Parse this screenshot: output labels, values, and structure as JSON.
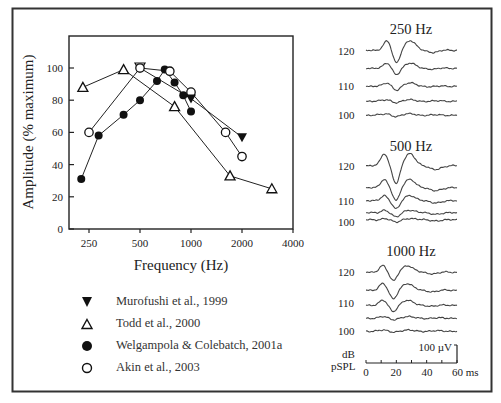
{
  "figure": {
    "frame_color": "#333333",
    "left_panel": {
      "ylabel": "Amplitude (% maximum)",
      "xlabel": "Frequency (Hz)",
      "yticks": [
        "0",
        "20",
        "40",
        "60",
        "80",
        "100"
      ],
      "xticks": [
        "250",
        "500",
        "1000",
        "2000",
        "4000"
      ]
    },
    "legend": [
      {
        "marker": "filled-down-triangle",
        "label": "Murofushi et al., 1999"
      },
      {
        "marker": "open-up-triangle",
        "label": "Todd et al., 2000"
      },
      {
        "marker": "filled-circle",
        "label": "Welgampola & Colebatch, 2001a"
      },
      {
        "marker": "open-circle",
        "label": "Akin et al., 2003"
      }
    ],
    "right_panel": {
      "panels": [
        {
          "title": "250 Hz",
          "labels": [
            "120",
            "110",
            "100"
          ]
        },
        {
          "title": "500 Hz",
          "labels": [
            "120",
            "110",
            "100"
          ]
        },
        {
          "title": "1000 Hz",
          "labels": [
            "120",
            "110",
            "100"
          ]
        }
      ],
      "unit_label_1": "dB",
      "unit_label_2": "pSPL",
      "scale_bar_label": "100 µV",
      "time_ticks": [
        "0",
        "20",
        "40",
        "60 ms"
      ]
    }
  },
  "chart_data": [
    {
      "type": "line",
      "title": "",
      "xlabel": "Frequency (Hz)",
      "ylabel": "Amplitude (% maximum)",
      "xscale": "log2",
      "xlim": [
        200,
        4000
      ],
      "ylim": [
        0,
        120
      ],
      "xticks": [
        250,
        500,
        1000,
        2000,
        4000
      ],
      "yticks": [
        0,
        20,
        40,
        60,
        80,
        100
      ],
      "grid": false,
      "legend_position": "below",
      "series": [
        {
          "name": "Murofushi et al., 1999",
          "marker": "filled-down-triangle",
          "x": [
            500,
            1000,
            2000
          ],
          "y": [
            100,
            81,
            57
          ]
        },
        {
          "name": "Todd et al., 2000",
          "marker": "open-up-triangle",
          "x": [
            230,
            400,
            800,
            1700,
            3000
          ],
          "y": [
            88,
            99,
            76,
            33,
            25
          ]
        },
        {
          "name": "Welgampola & Colebatch, 2001a",
          "marker": "filled-circle",
          "x": [
            225,
            285,
            400,
            500,
            630,
            700,
            800,
            900,
            1000
          ],
          "y": [
            31,
            58,
            71,
            80,
            92,
            99,
            91,
            83,
            73
          ]
        },
        {
          "name": "Akin et al., 2003",
          "marker": "open-circle",
          "x": [
            250,
            500,
            750,
            1000,
            1600,
            2000
          ],
          "y": [
            60,
            100,
            98,
            85,
            60,
            45
          ]
        }
      ]
    },
    {
      "type": "line",
      "title": "VEMP waveforms by stimulus frequency and intensity",
      "xlabel": "ms",
      "ylabel": "dB pSPL",
      "xlim": [
        0,
        60
      ],
      "xticks": [
        0,
        20,
        40,
        60
      ],
      "scale_bar": "100 µV",
      "panels": [
        {
          "title": "250 Hz",
          "levels_db": [
            120,
            115,
            110,
            105,
            100
          ],
          "p13_n23_amplitude_rel": [
            1.0,
            0.55,
            0.2,
            0.05,
            0.05
          ]
        },
        {
          "title": "500 Hz",
          "levels_db": [
            120,
            115,
            110,
            105,
            100
          ],
          "p13_n23_amplitude_rel": [
            1.6,
            1.1,
            0.7,
            0.35,
            0.15
          ]
        },
        {
          "title": "1000 Hz",
          "levels_db": [
            120,
            115,
            110,
            105,
            100
          ],
          "p13_n23_amplitude_rel": [
            1.0,
            0.9,
            0.6,
            0.1,
            0.05
          ]
        }
      ]
    }
  ]
}
